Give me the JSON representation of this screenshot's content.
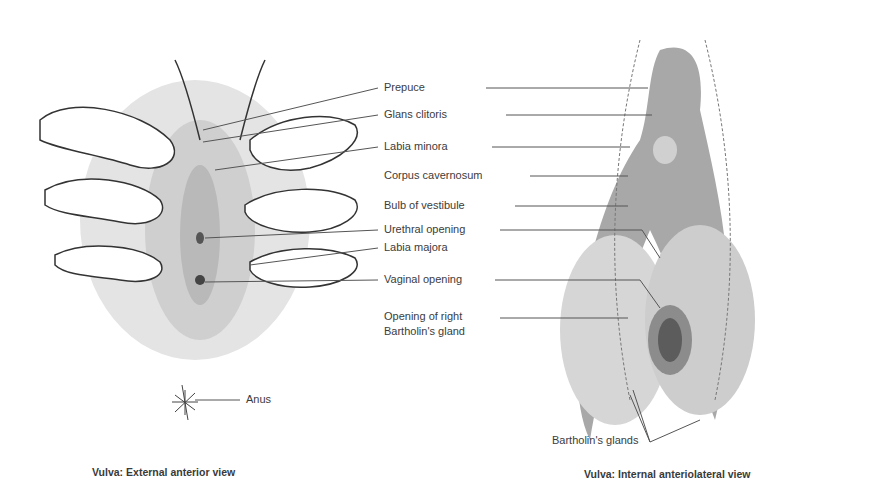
{
  "figure": {
    "left_panel": {
      "caption": "Vulva: External anterior view",
      "labels": {
        "prepuce": "Prepuce",
        "glans_clitoris": "Glans clitoris",
        "labia_minora": "Labia minora",
        "urethral_opening": "Urethral opening",
        "labia_majora": "Labia majora",
        "vaginal_opening": "Vaginal opening",
        "anus": "Anus"
      }
    },
    "right_panel": {
      "caption": "Vulva: Internal anteriolateral view",
      "labels": {
        "corpus_cavernosum": "Corpus cavernosum",
        "bulb_of_vestibule": "Bulb of vestibule",
        "opening_bartholin_line1": "Opening of right",
        "opening_bartholin_line2": "Bartholin's gland",
        "bartholins_glands": "Bartholin's glands"
      }
    }
  }
}
